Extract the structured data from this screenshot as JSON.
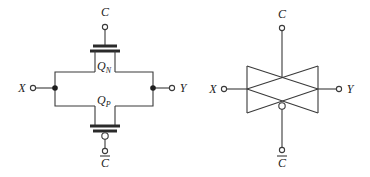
{
  "figure": {
    "left_diagram": {
      "name": "transmission-gate-transistor-level",
      "labels": {
        "control": "C",
        "control_bar": "C",
        "input": "X",
        "output": "Y",
        "nmos": "Q",
        "nmos_sub": "N",
        "pmos": "Q",
        "pmos_sub": "P"
      }
    },
    "right_diagram": {
      "name": "transmission-gate-symbol",
      "labels": {
        "control": "C",
        "control_bar": "C",
        "input": "X",
        "output": "Y"
      }
    },
    "colors": {
      "line": "#3a3a3a",
      "text": "#222222",
      "background": "#ffffff"
    }
  }
}
